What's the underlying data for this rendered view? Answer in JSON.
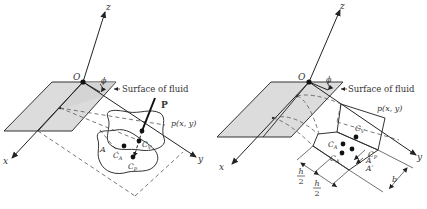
{
  "figures": [
    {
      "id": "left",
      "description": "Arbitrary submerged plane area inclined at angle phi to fluid surface",
      "labels": {
        "z_axis": "z",
        "x_axis": "x",
        "y_axis": "y",
        "origin": "O",
        "angle": "ϕ",
        "surface": "Surface of fluid",
        "force": "P",
        "pressure": "p(x, y)",
        "area": "A",
        "centroid": "C",
        "centroid_sub": "A",
        "center_volume": "C",
        "center_volume_sub": "V",
        "center_pressure": "C",
        "center_pressure_sub": "P"
      }
    },
    {
      "id": "right",
      "description": "Rectangular submerged plane of width b and height h with pressure prism",
      "labels": {
        "z_axis": "z",
        "x_axis": "x",
        "y_axis": "y",
        "origin": "O",
        "angle": "ϕ",
        "surface": "Surface of fluid",
        "pressure": "p(x, y)",
        "centroid": "C",
        "centroid_sub": "A",
        "centroid_prime": "C",
        "centroid_prime_sub": "A",
        "centroid_prime_mark": "′",
        "center_volume": "C",
        "center_volume_sub": "V",
        "center_pressure": "C",
        "center_pressure_sub": "P",
        "area": "A",
        "area_prime": "A′",
        "half_height_num": "h",
        "half_height_den": "2",
        "width": "b"
      }
    }
  ],
  "colors": {
    "ink": "#222222",
    "surface_fill": "#dcdcdc",
    "dashed": "#555555"
  }
}
